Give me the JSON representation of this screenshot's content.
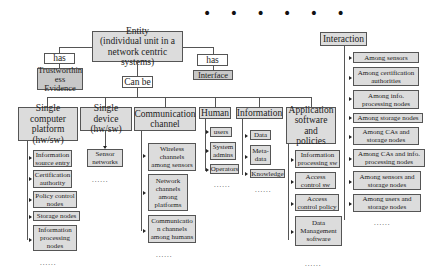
{
  "top_dots": "• • • • • •",
  "entity": {
    "label": "Entity\n(individual unit in a\nnetwork centric systems)"
  },
  "has_left": {
    "label": "has",
    "target": "Trustworthin\ness Evidence"
  },
  "has_right": {
    "label": "has",
    "target": "Interface"
  },
  "can_be": "Can be",
  "categories": [
    {
      "label": "Single computer\nplatform\n(hw/sw)",
      "children": [
        "Information\nsource entry",
        "Certification\nauthority",
        "Policy control\nnodes",
        "Storage nodes",
        "Information\nprocessing\nnodes"
      ],
      "more": "......"
    },
    {
      "label": "Single device\n(hw/sw)",
      "children": [
        "Sensor\nnetworks"
      ],
      "more": "......"
    },
    {
      "label": "Communication\nchannel",
      "children": [
        "Wireless\nchannels\namong sensors",
        "Network\nchannels\namong\nplatforms",
        "Communicatio\nn channels\namong humans"
      ],
      "more": "......"
    },
    {
      "label": "Human",
      "children": [
        "users",
        "System\nadmins",
        "Operators"
      ],
      "more": "......"
    },
    {
      "label": "Information",
      "children": [
        "Data",
        "Meta-\ndata",
        "Knowledge"
      ],
      "more": "......"
    },
    {
      "label": "Application\nsoftware and\npolicies",
      "children": [
        "Information\nprocessing sw",
        "Access\ncontrol sw",
        "Access\ncontrol policy",
        "Data\nManagement\nsoftware"
      ],
      "more": "......"
    }
  ],
  "interaction": {
    "label": "Interaction",
    "children": [
      "Among sensors",
      "Among certification\nauthorities",
      "Among info.\nprocessing  nodes",
      "Among storage nodes",
      "Among CAs and\nstorage nodes",
      "Among CAs and info.\nprocessing nodes",
      "Among sensors and\nstorage nodes",
      "Among users and\nstorage nodes"
    ],
    "more": "......"
  }
}
